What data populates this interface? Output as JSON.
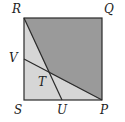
{
  "diagram": {
    "type": "geometry-square",
    "colors": {
      "dark_fill": "#9a9a9a",
      "light_fill": "#d6d6d6",
      "stroke": "#2a2a2a",
      "label": "#222222"
    },
    "labels": {
      "R": "R",
      "Q": "Q",
      "V": "V",
      "T": "T",
      "S": "S",
      "U": "U",
      "P": "P"
    },
    "points": {
      "R": [
        24,
        18
      ],
      "Q": [
        102,
        18
      ],
      "P": [
        102,
        100
      ],
      "S": [
        24,
        100
      ],
      "U": [
        62,
        100
      ],
      "V": [
        24,
        59
      ],
      "T": [
        49,
        73
      ]
    },
    "segments": [
      [
        "R",
        "Q"
      ],
      [
        "Q",
        "P"
      ],
      [
        "P",
        "S"
      ],
      [
        "S",
        "R"
      ],
      [
        "R",
        "U"
      ],
      [
        "V",
        "P"
      ]
    ]
  }
}
